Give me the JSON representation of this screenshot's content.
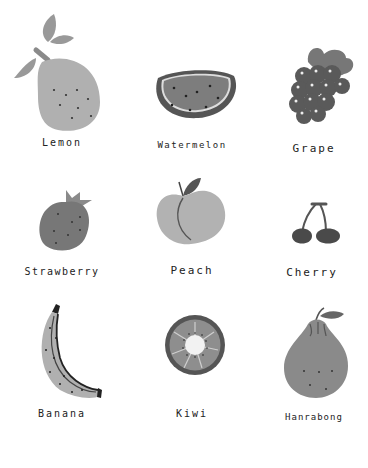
{
  "fruits": [
    {
      "name": "Lemon"
    },
    {
      "name": "Watermelon"
    },
    {
      "name": "Grape"
    },
    {
      "name": "Strawberry"
    },
    {
      "name": "Peach"
    },
    {
      "name": "Cherry"
    },
    {
      "name": "Banana"
    },
    {
      "name": "Kiwi"
    },
    {
      "name": "Hanrabong"
    }
  ],
  "colors": {
    "light": "#a9a9a9",
    "mid": "#8a8a8a",
    "dark": "#5e5e5e",
    "darker": "#444444",
    "background": "#ffffff"
  }
}
